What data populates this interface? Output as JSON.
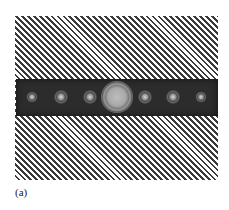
{
  "figure": {
    "label": "(a)",
    "spots": [
      {
        "order": -3,
        "x": 32,
        "y": 97,
        "size": "small"
      },
      {
        "order": -2,
        "x": 61,
        "y": 97,
        "size": "side"
      },
      {
        "order": -1,
        "x": 90,
        "y": 97,
        "size": "side"
      },
      {
        "order": 0,
        "x": 117,
        "y": 97,
        "size": "center"
      },
      {
        "order": 1,
        "x": 145,
        "y": 97,
        "size": "side"
      },
      {
        "order": 2,
        "x": 173,
        "y": 97,
        "size": "side"
      },
      {
        "order": 3,
        "x": 201,
        "y": 97,
        "size": "small"
      }
    ]
  }
}
